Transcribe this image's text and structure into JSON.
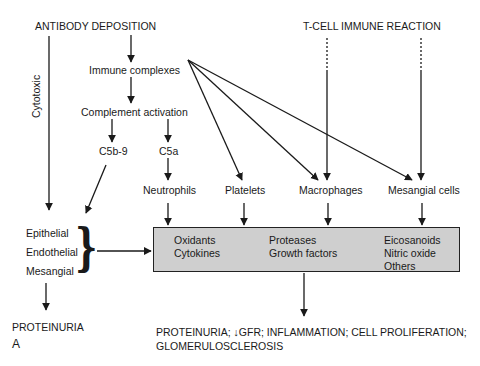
{
  "diagram": {
    "sources": {
      "antibody": "ANTIBODY DEPOSITION",
      "tcell": "T-CELL IMMUNE REACTION"
    },
    "side_label": "Cytotoxic",
    "nodes": {
      "immune_complexes": "Immune complexes",
      "complement_activation": "Complement activation",
      "c5b9": "C5b-9",
      "c5a": "C5a",
      "neutrophils": "Neutrophils",
      "platelets": "Platelets",
      "macrophages": "Macrophages",
      "mesangial_cells": "Mesangial cells"
    },
    "resident_cells": [
      "Epithelial",
      "Endothelial",
      "Mesangial"
    ],
    "mediator_box": {
      "columns": [
        [
          "Oxidants",
          "Cytokines"
        ],
        [
          "Proteases",
          "Growth factors"
        ],
        [
          "Eicosanoids",
          "Nitric oxide",
          "Others"
        ]
      ],
      "fill_color": "#cfcfcf"
    },
    "outcomes": {
      "left": "PROTEINURIA",
      "right_line1": "PROTEINURIA; ↓GFR; INFLAMMATION; CELL PROLIFERATION;",
      "right_line2": "GLOMERULOSCLEROSIS"
    },
    "panel_letter": "A",
    "edges": [
      [
        "ANTIBODY DEPOSITION",
        "Immune complexes"
      ],
      [
        "Immune complexes",
        "Complement activation"
      ],
      [
        "Complement activation",
        "C5b-9"
      ],
      [
        "Complement activation",
        "C5a"
      ],
      [
        "C5a",
        "Neutrophils"
      ],
      [
        "Immune complexes",
        "Platelets"
      ],
      [
        "Immune complexes",
        "Macrophages"
      ],
      [
        "Immune complexes",
        "Mesangial cells"
      ],
      [
        "T-CELL IMMUNE REACTION",
        "Macrophages",
        "dashed"
      ],
      [
        "T-CELL IMMUNE REACTION",
        "Mesangial cells",
        "dashed"
      ],
      [
        "ANTIBODY DEPOSITION",
        "Epithelial/Endothelial/Mesangial",
        "Cytotoxic"
      ],
      [
        "C5b-9",
        "Epithelial/Endothelial/Mesangial"
      ],
      [
        "Epithelial/Endothelial/Mesangial",
        "Mediators"
      ],
      [
        "Epithelial/Endothelial/Mesangial",
        "PROTEINURIA"
      ],
      [
        "Neutrophils",
        "Mediators"
      ],
      [
        "Platelets",
        "Mediators"
      ],
      [
        "Macrophages",
        "Mediators"
      ],
      [
        "Mesangial cells",
        "Mediators"
      ],
      [
        "Mediators",
        "Outcomes"
      ]
    ]
  }
}
